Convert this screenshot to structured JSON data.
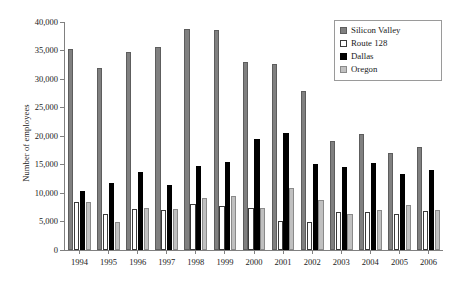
{
  "chart_data": {
    "type": "bar",
    "title": "",
    "xlabel": "",
    "ylabel": "Number of employees",
    "ylim": [
      0,
      40000
    ],
    "yticks": [
      0,
      5000,
      10000,
      15000,
      20000,
      25000,
      30000,
      35000,
      40000
    ],
    "ytick_labels": [
      "0",
      "5,000",
      "10,000",
      "15,000",
      "20,000",
      "25,000",
      "30,000",
      "35,000",
      "40,000"
    ],
    "grid": false,
    "legend_position": "top-right",
    "categories": [
      "1994",
      "1995",
      "1996",
      "1997",
      "1998",
      "1999",
      "2000",
      "2001",
      "2002",
      "2003",
      "2004",
      "2005",
      "2006"
    ],
    "series": [
      {
        "name": "Silicon Valley",
        "color": "#808080",
        "values": [
          35300,
          31900,
          34700,
          35700,
          38700,
          38600,
          33000,
          32600,
          27900,
          19200,
          20400,
          17100,
          18100
        ]
      },
      {
        "name": "Route 128",
        "color": "#ffffff",
        "values": [
          8400,
          6300,
          7200,
          7000,
          8000,
          7800,
          7400,
          5100,
          5000,
          6600,
          6600,
          6300,
          6900
        ]
      },
      {
        "name": "Dallas",
        "color": "#000000",
        "values": [
          10300,
          11800,
          13700,
          11400,
          14800,
          15500,
          19500,
          20500,
          15100,
          14600,
          15300,
          13400,
          14000
        ]
      },
      {
        "name": "Oregon",
        "color": "#c0c0c0",
        "values": [
          8400,
          4900,
          7300,
          7200,
          9200,
          9400,
          7400,
          10800,
          8800,
          6400,
          7000,
          7900,
          7100
        ]
      }
    ]
  },
  "legend": {
    "items": [
      {
        "label": "Silicon Valley"
      },
      {
        "label": "Route 128"
      },
      {
        "label": "Dallas"
      },
      {
        "label": "Oregon"
      }
    ]
  }
}
